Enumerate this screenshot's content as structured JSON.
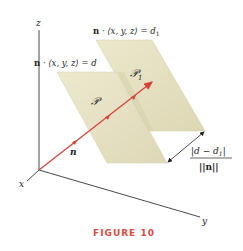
{
  "figure": {
    "caption": "FIGURE 10",
    "axes": {
      "x_label": "x",
      "y_label": "y",
      "z_label": "z"
    },
    "planes": [
      {
        "name": "P",
        "label": "𝒫",
        "equation_prefix": "n",
        "equation": " · ⟨x, y, z⟩ = d"
      },
      {
        "name": "P1",
        "label": "𝒫",
        "label_sub": "1",
        "equation_prefix": "n",
        "equation": " · ⟨x, y, z⟩ = d",
        "equation_sub": "1"
      }
    ],
    "normal_vector_label": "n",
    "distance_formula": {
      "numerator": "|d − d",
      "numerator_sub": "1",
      "numerator_end": "|",
      "denominator": "||n||"
    },
    "colors": {
      "plane_fill": "#e6e2c2",
      "plane_edge": "#d5cfa8",
      "vector": "#d9423a",
      "axis": "#333333",
      "caption": "#e0493f"
    }
  }
}
